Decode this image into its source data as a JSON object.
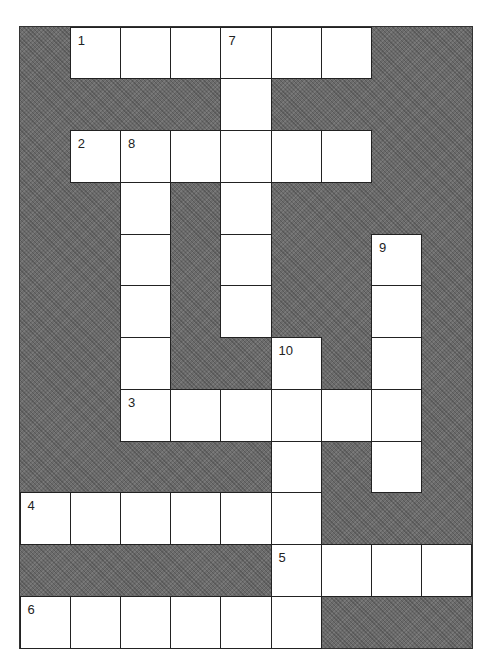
{
  "puzzle": {
    "type": "crossword",
    "cols": 9,
    "rows": 12,
    "colors": {
      "block": "#6b6b6b",
      "cell": "#ffffff",
      "line": "#222222"
    },
    "cells": [
      {
        "r": 0,
        "c": 1,
        "n": "1"
      },
      {
        "r": 0,
        "c": 2
      },
      {
        "r": 0,
        "c": 3
      },
      {
        "r": 0,
        "c": 4,
        "n": "7"
      },
      {
        "r": 0,
        "c": 5
      },
      {
        "r": 0,
        "c": 6
      },
      {
        "r": 1,
        "c": 4
      },
      {
        "r": 2,
        "c": 1,
        "n": "2"
      },
      {
        "r": 2,
        "c": 2,
        "n": "8"
      },
      {
        "r": 2,
        "c": 3
      },
      {
        "r": 2,
        "c": 4
      },
      {
        "r": 2,
        "c": 5
      },
      {
        "r": 2,
        "c": 6
      },
      {
        "r": 3,
        "c": 2
      },
      {
        "r": 3,
        "c": 4
      },
      {
        "r": 4,
        "c": 2
      },
      {
        "r": 4,
        "c": 4
      },
      {
        "r": 4,
        "c": 7,
        "n": "9"
      },
      {
        "r": 5,
        "c": 2
      },
      {
        "r": 5,
        "c": 4
      },
      {
        "r": 5,
        "c": 7
      },
      {
        "r": 6,
        "c": 2
      },
      {
        "r": 6,
        "c": 5,
        "n": "10"
      },
      {
        "r": 6,
        "c": 7
      },
      {
        "r": 7,
        "c": 2,
        "n": "3"
      },
      {
        "r": 7,
        "c": 3
      },
      {
        "r": 7,
        "c": 4
      },
      {
        "r": 7,
        "c": 5
      },
      {
        "r": 7,
        "c": 6
      },
      {
        "r": 7,
        "c": 7
      },
      {
        "r": 8,
        "c": 5
      },
      {
        "r": 8,
        "c": 7
      },
      {
        "r": 9,
        "c": 0,
        "n": "4"
      },
      {
        "r": 9,
        "c": 1
      },
      {
        "r": 9,
        "c": 2
      },
      {
        "r": 9,
        "c": 3
      },
      {
        "r": 9,
        "c": 4
      },
      {
        "r": 9,
        "c": 5
      },
      {
        "r": 10,
        "c": 5,
        "n": "5"
      },
      {
        "r": 10,
        "c": 6
      },
      {
        "r": 10,
        "c": 7
      },
      {
        "r": 10,
        "c": 8
      },
      {
        "r": 11,
        "c": 0,
        "n": "6"
      },
      {
        "r": 11,
        "c": 1
      },
      {
        "r": 11,
        "c": 2
      },
      {
        "r": 11,
        "c": 3
      },
      {
        "r": 11,
        "c": 4
      },
      {
        "r": 11,
        "c": 5
      }
    ],
    "across": [
      "1",
      "2",
      "3",
      "4",
      "5",
      "6"
    ],
    "down": [
      "7",
      "8",
      "9",
      "10"
    ]
  }
}
